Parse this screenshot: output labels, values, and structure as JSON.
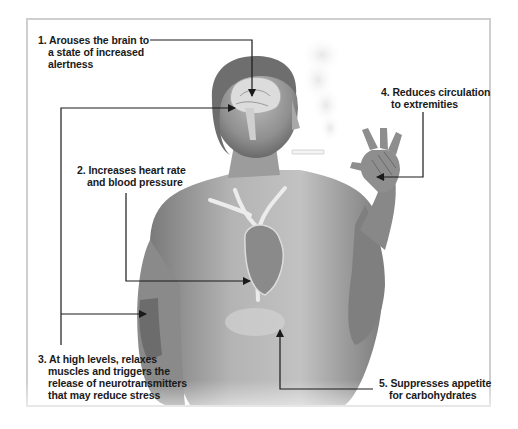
{
  "figure": {
    "annotations": [
      {
        "number": "1.",
        "lines": [
          "Arouses the brain to",
          "a state of increased",
          "alertness"
        ],
        "target": "brain"
      },
      {
        "number": "2.",
        "lines": [
          "Increases heart rate",
          "and blood pressure"
        ],
        "target": "heart"
      },
      {
        "number": "3.",
        "lines": [
          "At high levels, relaxes",
          "muscles and triggers the",
          "release of neurotransmitters",
          "that may reduce stress"
        ],
        "target": "brain and arm muscles"
      },
      {
        "number": "4.",
        "lines": [
          "Reduces circulation",
          "to extremities"
        ],
        "target": "hand"
      },
      {
        "number": "5.",
        "lines": [
          "Suppresses appetite",
          "for carbohydrates"
        ],
        "target": "stomach"
      }
    ],
    "colors": {
      "frame": "#cfcfcf",
      "leader_line": "#1a1a1a",
      "skin_dark": "#6f6f6f",
      "skin_light": "#c9c9c9",
      "organ_highlight": "#eeeeee"
    }
  }
}
